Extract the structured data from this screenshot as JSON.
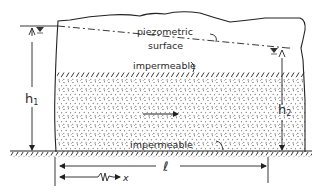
{
  "diagram": {
    "labels": {
      "piezometric_line1": "piezometric",
      "piezometric_line2": "surface",
      "impermeable_top": "impermeable",
      "impermeable_bottom": "impermeable",
      "h1": "h",
      "h1_sub": "1",
      "h2": "h",
      "h2_sub": "2",
      "length": "ℓ",
      "x": "x"
    },
    "elements": [
      "ground-surface-irregular",
      "piezometric-surface-dashed-line",
      "water-level-marker-left",
      "water-level-marker-right",
      "upper-impermeable-boundary-hatched",
      "aquifer-sand-stippled",
      "flow-direction-arrow",
      "lower-impermeable-boundary-hatched",
      "h1-dimension-arrow",
      "h2-dimension-arrow",
      "length-dimension-arrow",
      "x-coordinate-arrow"
    ],
    "colors": {
      "ink": "#222222",
      "background": "#ffffff"
    }
  }
}
